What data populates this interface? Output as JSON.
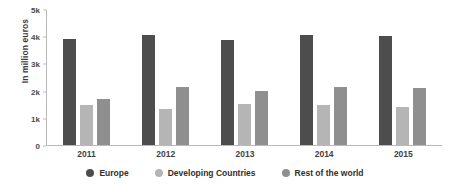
{
  "chart_data": {
    "type": "bar",
    "title": "",
    "xlabel": "",
    "ylabel": "In million euros",
    "categories": [
      "2011",
      "2012",
      "2013",
      "2014",
      "2015"
    ],
    "series": [
      {
        "name": "Europe",
        "color": "#4d4d4d",
        "values": [
          3900,
          4050,
          3850,
          4050,
          4020
        ]
      },
      {
        "name": "Developing Countries",
        "color": "#b5b5b5",
        "values": [
          1480,
          1330,
          1520,
          1480,
          1400
        ]
      },
      {
        "name": "Rest of the world",
        "color": "#8f8f8f",
        "values": [
          1700,
          2150,
          1980,
          2120,
          2080
        ]
      }
    ],
    "ylim": [
      0,
      5000
    ],
    "yticks": [
      0,
      1000,
      2000,
      3000,
      4000,
      5000
    ],
    "ytick_labels": [
      "0",
      "1k",
      "2k",
      "3k",
      "4k",
      "5k"
    ],
    "grid": false,
    "legend_position": "bottom"
  }
}
